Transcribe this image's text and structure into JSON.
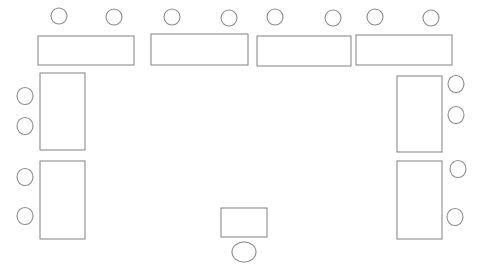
{
  "diagram": {
    "canvas": {
      "width": 482,
      "height": 278
    },
    "colors": {
      "background": "#ffffff",
      "stroke": "#8c8c8c",
      "fill": "#ffffff"
    },
    "stroke_width": 1.1,
    "tables": [
      {
        "id": "table-top-1",
        "name": "top-table-1",
        "x": 38,
        "y": 36,
        "width": 96,
        "height": 29
      },
      {
        "id": "table-top-2",
        "name": "top-table-2",
        "x": 151,
        "y": 34,
        "width": 97,
        "height": 31
      },
      {
        "id": "table-top-3",
        "name": "top-table-3",
        "x": 257,
        "y": 36,
        "width": 94,
        "height": 30
      },
      {
        "id": "table-top-4",
        "name": "top-table-4",
        "x": 356,
        "y": 35,
        "width": 96,
        "height": 30
      },
      {
        "id": "table-left-1",
        "name": "left-table-upper",
        "x": 40,
        "y": 73,
        "width": 45,
        "height": 77
      },
      {
        "id": "table-left-2",
        "name": "left-table-lower",
        "x": 40,
        "y": 161,
        "width": 45,
        "height": 78
      },
      {
        "id": "table-right-1",
        "name": "right-table-upper",
        "x": 397,
        "y": 76,
        "width": 45,
        "height": 76
      },
      {
        "id": "table-right-2",
        "name": "right-table-lower",
        "x": 397,
        "y": 161,
        "width": 45,
        "height": 78
      },
      {
        "id": "table-bottom-1",
        "name": "bottom-center-table",
        "x": 221,
        "y": 208,
        "width": 46,
        "height": 29
      }
    ],
    "chairs": [
      {
        "id": "chair-top-1",
        "name": "chair-top-1",
        "cx": 59,
        "cy": 16,
        "rx": 8,
        "ry": 8
      },
      {
        "id": "chair-top-2",
        "name": "chair-top-2",
        "cx": 114,
        "cy": 17,
        "rx": 8,
        "ry": 8
      },
      {
        "id": "chair-top-3",
        "name": "chair-top-3",
        "cx": 172,
        "cy": 17,
        "rx": 8,
        "ry": 8
      },
      {
        "id": "chair-top-4",
        "name": "chair-top-4",
        "cx": 229,
        "cy": 18,
        "rx": 8,
        "ry": 8
      },
      {
        "id": "chair-top-5",
        "name": "chair-top-5",
        "cx": 275,
        "cy": 17,
        "rx": 8,
        "ry": 8
      },
      {
        "id": "chair-top-6",
        "name": "chair-top-6",
        "cx": 333,
        "cy": 18,
        "rx": 8,
        "ry": 8
      },
      {
        "id": "chair-top-7",
        "name": "chair-top-7",
        "cx": 375,
        "cy": 17,
        "rx": 8,
        "ry": 8
      },
      {
        "id": "chair-top-8",
        "name": "chair-top-8",
        "cx": 431,
        "cy": 18,
        "rx": 8,
        "ry": 8
      },
      {
        "id": "chair-left-1",
        "name": "chair-left-1",
        "cx": 25,
        "cy": 96,
        "rx": 8,
        "ry": 8.5
      },
      {
        "id": "chair-left-2",
        "name": "chair-left-2",
        "cx": 25,
        "cy": 126,
        "rx": 8,
        "ry": 8.5
      },
      {
        "id": "chair-left-3",
        "name": "chair-left-3",
        "cx": 25,
        "cy": 177,
        "rx": 8,
        "ry": 8.5
      },
      {
        "id": "chair-left-4",
        "name": "chair-left-4",
        "cx": 25,
        "cy": 216,
        "rx": 8,
        "ry": 8.5
      },
      {
        "id": "chair-right-1",
        "name": "chair-right-1",
        "cx": 456,
        "cy": 84,
        "rx": 8,
        "ry": 8.5
      },
      {
        "id": "chair-right-2",
        "name": "chair-right-2",
        "cx": 456,
        "cy": 115,
        "rx": 8,
        "ry": 8.5
      },
      {
        "id": "chair-right-3",
        "name": "chair-right-3",
        "cx": 458,
        "cy": 169,
        "rx": 8,
        "ry": 8.5
      },
      {
        "id": "chair-right-4",
        "name": "chair-right-4",
        "cx": 455,
        "cy": 217,
        "rx": 8,
        "ry": 8.5
      },
      {
        "id": "chair-bottom-1",
        "name": "chair-bottom-center",
        "cx": 244,
        "cy": 252,
        "rx": 12,
        "ry": 10
      }
    ],
    "counts": {
      "tables_total": 9,
      "chairs_total": 17
    }
  }
}
